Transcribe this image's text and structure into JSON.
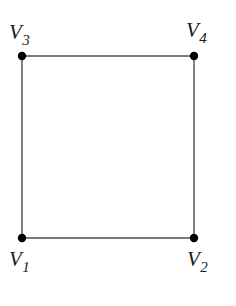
{
  "figure": {
    "type": "graph-diagram",
    "background_color": "#ffffff",
    "edge_color": "#4d4d4d",
    "vertex_color": "#000000",
    "label_color": "#1a1a1a",
    "edge_width": 1.4,
    "vertex_radius": 4.2,
    "width": 236,
    "height": 306
  },
  "vertices": [
    {
      "id": "v3",
      "label_base": "V",
      "label_sub": "3",
      "x": 22,
      "y": 56
    },
    {
      "id": "v4",
      "label_base": "V",
      "label_sub": "4",
      "x": 194,
      "y": 56
    },
    {
      "id": "v1",
      "label_base": "V",
      "label_sub": "1",
      "x": 22,
      "y": 238
    },
    {
      "id": "v2",
      "label_base": "V",
      "label_sub": "2",
      "x": 194,
      "y": 238
    }
  ],
  "edges": [
    {
      "id": "edge-v3-v4",
      "from": "v3",
      "to": "v4",
      "x1": 22,
      "y1": 56,
      "x2": 194,
      "y2": 56
    },
    {
      "id": "edge-v1-v2",
      "from": "v1",
      "to": "v2",
      "x1": 22,
      "y1": 238,
      "x2": 194,
      "y2": 238
    },
    {
      "id": "edge-v3-v1",
      "from": "v3",
      "to": "v1",
      "x1": 22,
      "y1": 56,
      "x2": 22,
      "y2": 238
    },
    {
      "id": "edge-v4-v2",
      "from": "v4",
      "to": "v2",
      "x1": 194,
      "y1": 56,
      "x2": 194,
      "y2": 238
    }
  ],
  "labels": {
    "v1": {
      "base": "V",
      "sub": "1"
    },
    "v2": {
      "base": "V",
      "sub": "2"
    },
    "v3": {
      "base": "V",
      "sub": "3"
    },
    "v4": {
      "base": "V",
      "sub": "4"
    }
  }
}
